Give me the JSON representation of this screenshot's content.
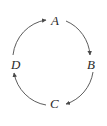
{
  "diagram": {
    "type": "directed-cycle",
    "direction": "clockwise",
    "background_color": "#ffffff",
    "stroke_color": "#4a4a4a",
    "label_color": "#2b2b2b",
    "nodes": [
      {
        "id": "A",
        "label": "A",
        "position": "top",
        "x": 56,
        "y": 21
      },
      {
        "id": "B",
        "label": "B",
        "position": "right",
        "x": 91,
        "y": 65
      },
      {
        "id": "C",
        "label": "C",
        "position": "bottom",
        "x": 55,
        "y": 104
      },
      {
        "id": "D",
        "label": "D",
        "position": "left",
        "x": 16,
        "y": 65
      }
    ],
    "edges": [
      {
        "from": "D",
        "to": "A",
        "arrowhead": "at-A",
        "curve": "arc"
      },
      {
        "from": "A",
        "to": "B",
        "arrowhead": "at-B",
        "curve": "arc"
      },
      {
        "from": "B",
        "to": "C",
        "arrowhead": "at-C",
        "curve": "arc"
      },
      {
        "from": "C",
        "to": "D",
        "arrowhead": "at-D",
        "curve": "arc"
      }
    ]
  }
}
